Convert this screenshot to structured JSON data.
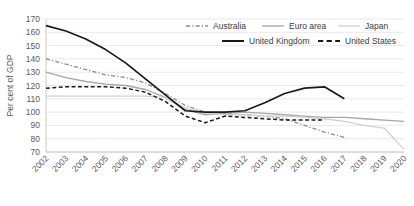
{
  "chart_data": {
    "type": "line",
    "title": "",
    "xlabel": "",
    "ylabel": "Per cent of GDP",
    "ylim": [
      70,
      170
    ],
    "ytick_step": 10,
    "yticks": [
      70,
      80,
      90,
      100,
      110,
      120,
      130,
      140,
      150,
      160,
      170
    ],
    "grid": true,
    "grid_axis": "y",
    "legend_position": "top-right",
    "x": [
      2002,
      2003,
      2004,
      2005,
      2006,
      2007,
      2008,
      2009,
      2010,
      2011,
      2012,
      2013,
      2014,
      2015,
      2016,
      2017,
      2018,
      2019,
      2020
    ],
    "categories": [
      "2002",
      "2003",
      "2004",
      "2005",
      "2006",
      "2007",
      "2008",
      "2009",
      "2010",
      "2011",
      "2012",
      "2013",
      "2014",
      "2015",
      "2016",
      "2017",
      "2018",
      "2019",
      "2020"
    ],
    "series": [
      {
        "name": "Australia",
        "color": "#8c8c8c",
        "style": "dashdot",
        "width": 1.3,
        "x": [
          2002,
          2003,
          2004,
          2005,
          2006,
          2007,
          2008,
          2009,
          2010,
          2011,
          2012,
          2013,
          2014,
          2015,
          2016,
          2017
        ],
        "values": [
          140,
          136,
          132,
          128,
          126,
          122,
          114,
          105,
          100,
          99,
          98,
          97,
          95,
          90,
          85,
          81
        ]
      },
      {
        "name": "Euro area",
        "color": "#a6a6a6",
        "style": "solid",
        "width": 1.3,
        "x": [
          2002,
          2003,
          2004,
          2005,
          2006,
          2007,
          2008,
          2009,
          2010,
          2011,
          2012,
          2013,
          2014,
          2015,
          2016,
          2017,
          2018,
          2019,
          2020
        ],
        "values": [
          130,
          126,
          123,
          121,
          120,
          117,
          111,
          102,
          98,
          99,
          100,
          99,
          98,
          97,
          96,
          96,
          95,
          94,
          93
        ]
      },
      {
        "name": "Japan",
        "color": "#d0d0d0",
        "style": "solid",
        "width": 1.3,
        "x": [
          2002,
          2003,
          2004,
          2005,
          2006,
          2007,
          2008,
          2009,
          2010,
          2011,
          2012,
          2013,
          2014,
          2015,
          2016,
          2017,
          2018,
          2019,
          2020
        ],
        "values": [
          112,
          112,
          112,
          112,
          112,
          112,
          111,
          103,
          99,
          98,
          98,
          97,
          97,
          96,
          95,
          93,
          90,
          88,
          72
        ]
      },
      {
        "name": "United Kingdom",
        "color": "#1a1a1a",
        "style": "solid",
        "width": 1.7,
        "x": [
          2002,
          2003,
          2004,
          2005,
          2006,
          2007,
          2008,
          2009,
          2010,
          2011,
          2012,
          2013,
          2014,
          2015,
          2016,
          2017
        ],
        "values": [
          165,
          161,
          155,
          147,
          137,
          125,
          113,
          101,
          100,
          100,
          101,
          107,
          114,
          118,
          119,
          110
        ]
      },
      {
        "name": "United States",
        "color": "#1a1a1a",
        "style": "dashed",
        "width": 1.5,
        "x": [
          2002,
          2003,
          2004,
          2005,
          2006,
          2007,
          2008,
          2009,
          2010,
          2011,
          2012,
          2013,
          2014,
          2015,
          2016
        ],
        "values": [
          118,
          119,
          119,
          119,
          118,
          115,
          108,
          97,
          92,
          97,
          96,
          95,
          94,
          94,
          94
        ]
      }
    ],
    "legend": [
      {
        "label": "Australia",
        "color": "#8c8c8c",
        "style": "dashdot"
      },
      {
        "label": "Euro area",
        "color": "#a6a6a6",
        "style": "solid"
      },
      {
        "label": "Japan",
        "color": "#d0d0d0",
        "style": "solid"
      },
      {
        "label": "United Kingdom",
        "color": "#1a1a1a",
        "style": "solid"
      },
      {
        "label": "United States",
        "color": "#1a1a1a",
        "style": "dashed"
      }
    ]
  }
}
